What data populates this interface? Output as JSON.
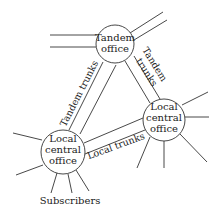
{
  "diagram": {
    "nodes": {
      "tandem": {
        "line1": "Tandem",
        "line2": "office"
      },
      "local_left": {
        "line1": "Local",
        "line2": "central",
        "line3": "office"
      },
      "local_right": {
        "line1": "Local",
        "line2": "central",
        "line3": "office"
      }
    },
    "edges": {
      "tandem_left": "Tandem trunks",
      "tandem_right_line1": "Tandem",
      "tandem_right_line2": "trunks",
      "local": "Local trunks"
    },
    "subscribers_label": "Subscribers",
    "colors": {
      "line": "#333333",
      "text": "#222222",
      "background": "#ffffff"
    }
  }
}
